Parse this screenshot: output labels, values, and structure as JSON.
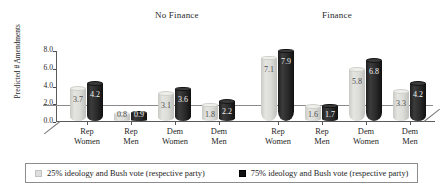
{
  "chart_data": {
    "type": "bar",
    "title": "",
    "xlabel": "",
    "ylabel": "Predicted # Amendments",
    "ylim": [
      0.0,
      8.0
    ],
    "ytick_labels": [
      "0.0",
      "2.0",
      "4.0",
      "6.0",
      "8.0"
    ],
    "ytick_values": [
      0.0,
      2.0,
      4.0,
      6.0,
      8.0
    ],
    "grid": false,
    "legend_position": "bottom",
    "panels": [
      {
        "title": "No Finance",
        "categories": [
          "Rep Women",
          "Rep Men",
          "Dem Women",
          "Dem Men"
        ],
        "series": [
          {
            "name": "25% ideology and Bush vote (respective party)",
            "values": [
              3.7,
              0.8,
              3.1,
              1.8
            ]
          },
          {
            "name": "75% ideology and Bush vote (respective party)",
            "values": [
              4.2,
              0.9,
              3.6,
              2.2
            ]
          }
        ]
      },
      {
        "title": "Finance",
        "categories": [
          "Rep Women",
          "Rep Men",
          "Dem Women",
          "Dem Men"
        ],
        "series": [
          {
            "name": "25% ideology and Bush vote (respective party)",
            "values": [
              7.1,
              1.6,
              5.8,
              3.3
            ]
          },
          {
            "name": "75% ideology and Bush vote (respective party)",
            "values": [
              7.9,
              1.7,
              6.8,
              4.2
            ]
          }
        ]
      }
    ],
    "legend": [
      {
        "label": "25% ideology and Bush vote (respective party)",
        "color": "#dedede"
      },
      {
        "label": "75% ideology and Bush vote (respective party)",
        "color": "#111111"
      }
    ]
  },
  "axis": {
    "y_label_line1": "Predicted #",
    "y_label_line2": "Amendments",
    "ticks": [
      "8.0",
      "6.0",
      "4.0",
      "2.0",
      "0.0"
    ]
  },
  "categories_display": [
    {
      "line1": "Rep",
      "line2": "Women"
    },
    {
      "line1": "Rep",
      "line2": "Men"
    },
    {
      "line1": "Dem",
      "line2": "Women"
    },
    {
      "line1": "Dem",
      "line2": "Men"
    }
  ],
  "values_display": {
    "p0s0": [
      "3.7",
      "0.8",
      "3.1",
      "1.8"
    ],
    "p0s1": [
      "4.2",
      "0.9",
      "3.6",
      "2.2"
    ],
    "p1s0": [
      "7.1",
      "1.6",
      "5.8",
      "3.3"
    ],
    "p1s1": [
      "7.9",
      "1.7",
      "6.8",
      "4.2"
    ]
  },
  "legend_labels": {
    "light": "25% ideology and Bush vote (respective party)",
    "dark": "75% ideology and Bush vote (respective party)"
  }
}
